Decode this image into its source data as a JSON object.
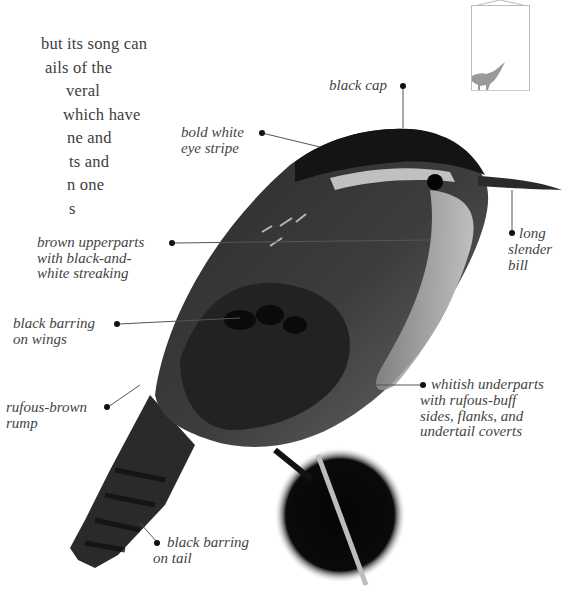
{
  "page": {
    "type": "field-guide-page"
  },
  "body_text": {
    "lines": [
      "but its song can",
      "ails of the",
      "veral",
      "which have",
      "ne and",
      "ts and",
      "n one",
      "s"
    ]
  },
  "annotations": [
    {
      "id": "black-cap",
      "lines": [
        "black cap"
      ]
    },
    {
      "id": "bold-white-eye-stripe",
      "lines": [
        "bold white",
        "eye stripe"
      ]
    },
    {
      "id": "brown-upperparts",
      "lines": [
        "brown upperparts",
        "with black-and-",
        "white streaking"
      ]
    },
    {
      "id": "long-slender-bill",
      "lines": [
        "long",
        "slender",
        "bill"
      ]
    },
    {
      "id": "black-barring-wings",
      "lines": [
        "black barring",
        "on wings"
      ]
    },
    {
      "id": "rufous-brown-rump",
      "lines": [
        "rufous-brown",
        "rump"
      ]
    },
    {
      "id": "whitish-underparts",
      "lines": [
        "whitish underparts",
        "with rufous-buff",
        "sides, flanks, and",
        "undertail coverts"
      ]
    },
    {
      "id": "black-barring-tail",
      "lines": [
        "black barring",
        "on tail"
      ]
    }
  ],
  "thumbnail": {
    "icon": "bird-silhouette-icon",
    "color": "#9a9a9a"
  },
  "colors": {
    "text": "#3d3d3d",
    "leader": "#555555",
    "dot": "#111111",
    "bird_dark": "#1a1a1a",
    "bird_mid": "#4a4a4a",
    "bird_light": "#bdbdbd"
  }
}
